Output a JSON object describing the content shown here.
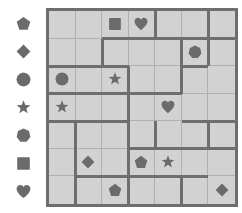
{
  "puzzle": {
    "title": "shape-logic-grid",
    "grid_size": {
      "rows": 7,
      "cols": 7
    },
    "colors": {
      "cell_background": "#d2d2d2",
      "thin_line": "#b0b0b0",
      "thick_line": "#6e6e6e",
      "shape_fill": "#6b6b6b",
      "page_background": "#ffffff"
    },
    "legend": {
      "name": "shape-legend",
      "items": [
        {
          "index": 0,
          "icon": "pentagon-icon",
          "label": "pentagon"
        },
        {
          "index": 1,
          "icon": "diamond-icon",
          "label": "diamond"
        },
        {
          "index": 2,
          "icon": "circle-icon",
          "label": "circle"
        },
        {
          "index": 3,
          "icon": "star-icon",
          "label": "star"
        },
        {
          "index": 4,
          "icon": "hexagon-icon",
          "label": "hexagon"
        },
        {
          "index": 5,
          "icon": "square-icon",
          "label": "square"
        },
        {
          "index": 6,
          "icon": "heart-icon",
          "label": "heart"
        }
      ]
    },
    "cells": [
      {
        "row": 1,
        "col": 1,
        "shape": null
      },
      {
        "row": 1,
        "col": 2,
        "shape": null
      },
      {
        "row": 1,
        "col": 3,
        "shape": "square"
      },
      {
        "row": 1,
        "col": 4,
        "shape": "heart"
      },
      {
        "row": 1,
        "col": 5,
        "shape": null
      },
      {
        "row": 1,
        "col": 6,
        "shape": null
      },
      {
        "row": 1,
        "col": 7,
        "shape": null
      },
      {
        "row": 2,
        "col": 1,
        "shape": null
      },
      {
        "row": 2,
        "col": 2,
        "shape": null
      },
      {
        "row": 2,
        "col": 3,
        "shape": null
      },
      {
        "row": 2,
        "col": 4,
        "shape": null
      },
      {
        "row": 2,
        "col": 5,
        "shape": null
      },
      {
        "row": 2,
        "col": 6,
        "shape": "hexagon"
      },
      {
        "row": 2,
        "col": 7,
        "shape": null
      },
      {
        "row": 3,
        "col": 1,
        "shape": "circle"
      },
      {
        "row": 3,
        "col": 2,
        "shape": null
      },
      {
        "row": 3,
        "col": 3,
        "shape": "star"
      },
      {
        "row": 3,
        "col": 4,
        "shape": null
      },
      {
        "row": 3,
        "col": 5,
        "shape": null
      },
      {
        "row": 3,
        "col": 6,
        "shape": null
      },
      {
        "row": 3,
        "col": 7,
        "shape": null
      },
      {
        "row": 4,
        "col": 1,
        "shape": "star"
      },
      {
        "row": 4,
        "col": 2,
        "shape": null
      },
      {
        "row": 4,
        "col": 3,
        "shape": null
      },
      {
        "row": 4,
        "col": 4,
        "shape": null
      },
      {
        "row": 4,
        "col": 5,
        "shape": "heart"
      },
      {
        "row": 4,
        "col": 6,
        "shape": null
      },
      {
        "row": 4,
        "col": 7,
        "shape": null
      },
      {
        "row": 5,
        "col": 1,
        "shape": null
      },
      {
        "row": 5,
        "col": 2,
        "shape": null
      },
      {
        "row": 5,
        "col": 3,
        "shape": null
      },
      {
        "row": 5,
        "col": 4,
        "shape": null
      },
      {
        "row": 5,
        "col": 5,
        "shape": null
      },
      {
        "row": 5,
        "col": 6,
        "shape": null
      },
      {
        "row": 5,
        "col": 7,
        "shape": null
      },
      {
        "row": 6,
        "col": 1,
        "shape": null
      },
      {
        "row": 6,
        "col": 2,
        "shape": "diamond"
      },
      {
        "row": 6,
        "col": 3,
        "shape": null
      },
      {
        "row": 6,
        "col": 4,
        "shape": "pentagon"
      },
      {
        "row": 6,
        "col": 5,
        "shape": "star"
      },
      {
        "row": 6,
        "col": 6,
        "shape": null
      },
      {
        "row": 6,
        "col": 7,
        "shape": null
      },
      {
        "row": 7,
        "col": 1,
        "shape": null
      },
      {
        "row": 7,
        "col": 2,
        "shape": null
      },
      {
        "row": 7,
        "col": 3,
        "shape": "pentagon"
      },
      {
        "row": 7,
        "col": 4,
        "shape": null
      },
      {
        "row": 7,
        "col": 5,
        "shape": null
      },
      {
        "row": 7,
        "col": 6,
        "shape": null
      },
      {
        "row": 7,
        "col": 7,
        "shape": "diamond"
      }
    ],
    "cage_edges": {
      "horizontal": [
        {
          "row_below": 1,
          "col_start": 3,
          "col_end": 4
        },
        {
          "row_below": 1,
          "col_start": 5,
          "col_end": 7
        },
        {
          "row_below": 2,
          "col_start": 1,
          "col_end": 1
        },
        {
          "row_below": 2,
          "col_start": 6,
          "col_end": 6
        },
        {
          "row_below": 2,
          "col_start": 2,
          "col_end": 3
        },
        {
          "row_below": 3,
          "col_start": 4,
          "col_end": 5
        },
        {
          "row_below": 3,
          "col_start": 1,
          "col_end": 3
        },
        {
          "row_below": 4,
          "col_start": 1,
          "col_end": 3
        },
        {
          "row_below": 4,
          "col_start": 6,
          "col_end": 7
        },
        {
          "row_below": 5,
          "col_start": 4,
          "col_end": 4
        },
        {
          "row_below": 5,
          "col_start": 5,
          "col_end": 7
        },
        {
          "row_below": 6,
          "col_start": 2,
          "col_end": 3
        },
        {
          "row_below": 6,
          "col_start": 4,
          "col_end": 6
        }
      ],
      "vertical": [
        {
          "col_right": 2,
          "row_start": 2,
          "row_end": 2
        },
        {
          "col_right": 4,
          "row_start": 1,
          "row_end": 1
        },
        {
          "col_right": 5,
          "row_start": 2,
          "row_end": 2
        },
        {
          "col_right": 3,
          "row_start": 3,
          "row_end": 4
        },
        {
          "col_right": 5,
          "row_start": 3,
          "row_end": 3
        },
        {
          "col_right": 1,
          "row_start": 5,
          "row_end": 7
        },
        {
          "col_right": 3,
          "row_start": 6,
          "row_end": 7
        },
        {
          "col_right": 4,
          "row_start": 5,
          "row_end": 5
        },
        {
          "col_right": 3,
          "row_start": 5,
          "row_end": 5
        },
        {
          "col_right": 5,
          "row_start": 7,
          "row_end": 7
        },
        {
          "col_right": 6,
          "row_start": 1,
          "row_end": 1
        },
        {
          "col_right": 6,
          "row_start": 5,
          "row_end": 5
        },
        {
          "col_right": 6,
          "row_start": 2,
          "row_end": 2
        }
      ]
    }
  }
}
